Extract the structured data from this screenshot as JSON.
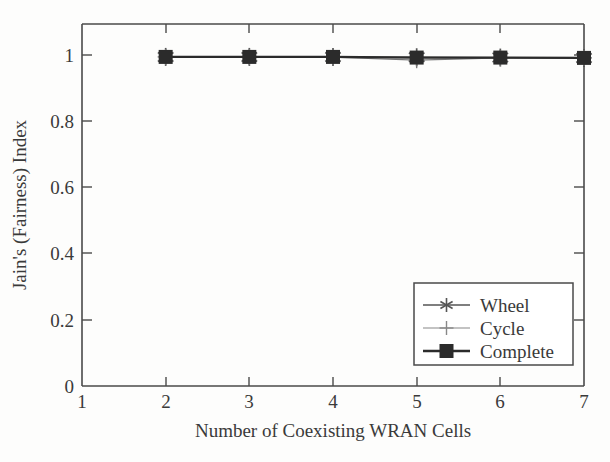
{
  "chart_data": {
    "type": "line",
    "title": "",
    "xlabel": "Number of Coexisting WRAN Cells",
    "ylabel": "Jain's (Fairness) Index",
    "xlim": [
      1,
      7
    ],
    "ylim": [
      0,
      1.1
    ],
    "xticks": [
      "1",
      "2",
      "3",
      "4",
      "5",
      "6",
      "7"
    ],
    "xtick_values": [
      1,
      2,
      3,
      4,
      5,
      6,
      7
    ],
    "yticks": [
      "0",
      "0.2",
      "0.4",
      "0.6",
      "0.8",
      "1"
    ],
    "ytick_values": [
      0,
      0.2,
      0.4,
      0.6,
      0.8,
      1
    ],
    "grid": false,
    "legend_position": "lower right",
    "x": [
      2,
      3,
      4,
      5,
      6,
      7
    ],
    "series": [
      {
        "name": "Wheel",
        "marker": "asterisk",
        "color": "#555555",
        "linewidth": 1.3,
        "values": [
          1.0,
          1.0,
          1.0,
          0.999,
          0.998,
          0.997
        ]
      },
      {
        "name": "Cycle",
        "marker": "plus",
        "color": "#777777",
        "linewidth": 1.2,
        "values": [
          1.0,
          1.0,
          0.999,
          0.99,
          0.997,
          0.997
        ]
      },
      {
        "name": "Complete",
        "marker": "filled-square",
        "color": "#2b2b2b",
        "linewidth": 2.2,
        "values": [
          1.0,
          1.0,
          1.0,
          0.998,
          0.998,
          0.997
        ]
      }
    ]
  },
  "legend": {
    "entries": [
      {
        "label": "Wheel"
      },
      {
        "label": "Cycle"
      },
      {
        "label": "Complete"
      }
    ]
  },
  "axes": {
    "x_title": "Number of Coexisting WRAN Cells",
    "y_title": "Jain's (Fairness) Index"
  }
}
